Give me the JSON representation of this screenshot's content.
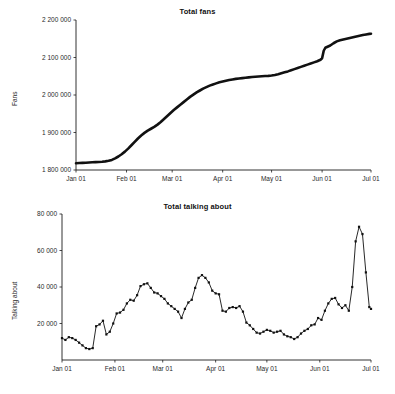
{
  "page": {
    "background": "#ffffff",
    "ink": "#111111",
    "width": 395,
    "height": 394
  },
  "chart_data": [
    {
      "id": "total-fans",
      "type": "line",
      "title": "Total fans",
      "xlabel": "",
      "ylabel": "Fans",
      "ylim": [
        1800000,
        2200000
      ],
      "yticks": [
        1800000,
        1900000,
        2000000,
        2100000,
        2200000
      ],
      "ytick_labels": [
        "1 800 000",
        "1 900 000",
        "2 000 000",
        "2 100 000",
        "2 200 000"
      ],
      "xticks": [
        0,
        31,
        59,
        90,
        120,
        151,
        181
      ],
      "xtick_labels": [
        "Jan 01",
        "Feb 01",
        "Mar 01",
        "Apr 01",
        "May 01",
        "Jun 01",
        "Jul 01"
      ],
      "xlim": [
        0,
        181
      ],
      "grid": false,
      "legend": false,
      "markers": false,
      "line_color": "#111111",
      "series": [
        {
          "name": "Total fans",
          "x": [
            0,
            2,
            4,
            6,
            8,
            10,
            12,
            14,
            16,
            18,
            20,
            22,
            24,
            26,
            28,
            30,
            32,
            34,
            36,
            38,
            40,
            42,
            44,
            46,
            48,
            50,
            52,
            54,
            56,
            58,
            60,
            62,
            64,
            66,
            68,
            70,
            72,
            74,
            76,
            78,
            80,
            82,
            84,
            86,
            88,
            90,
            92,
            94,
            96,
            98,
            100,
            102,
            104,
            106,
            108,
            110,
            112,
            114,
            116,
            118,
            120,
            122,
            124,
            126,
            128,
            130,
            132,
            134,
            136,
            138,
            140,
            142,
            144,
            146,
            148,
            150,
            151,
            152,
            153,
            154,
            156,
            158,
            160,
            162,
            164,
            166,
            168,
            170,
            172,
            174,
            176,
            178,
            180,
            181
          ],
          "values": [
            1818000,
            1818500,
            1819000,
            1819500,
            1820000,
            1820500,
            1821000,
            1821500,
            1822000,
            1823000,
            1824500,
            1827000,
            1831000,
            1836000,
            1842000,
            1849000,
            1857000,
            1866000,
            1875000,
            1884000,
            1892000,
            1899000,
            1905000,
            1910000,
            1915000,
            1921000,
            1928000,
            1936000,
            1944000,
            1952000,
            1960000,
            1967000,
            1974000,
            1981000,
            1988000,
            1995000,
            2001000,
            2007000,
            2012000,
            2017000,
            2021000,
            2025000,
            2028000,
            2031000,
            2034000,
            2036000,
            2038000,
            2040000,
            2041500,
            2043000,
            2044000,
            2045000,
            2046000,
            2047000,
            2048000,
            2048800,
            2049500,
            2050000,
            2050500,
            2051000,
            2052000,
            2053500,
            2055500,
            2058000,
            2060500,
            2063000,
            2066000,
            2069000,
            2072000,
            2075000,
            2078000,
            2081000,
            2084000,
            2087000,
            2090000,
            2094000,
            2098000,
            2118000,
            2126000,
            2128000,
            2132000,
            2138000,
            2143000,
            2146000,
            2148000,
            2150000,
            2152000,
            2154000,
            2156000,
            2158000,
            2160000,
            2161500,
            2163000,
            2163500
          ]
        }
      ]
    },
    {
      "id": "total-talking-about",
      "type": "line",
      "title": "Total talking about",
      "xlabel": "",
      "ylabel": "Talking about",
      "ylim": [
        0,
        80000
      ],
      "yticks": [
        20000,
        40000,
        60000,
        80000
      ],
      "ytick_labels": [
        "20 000",
        "40 000",
        "60 000",
        "80 000"
      ],
      "xticks": [
        0,
        31,
        59,
        90,
        120,
        151,
        181
      ],
      "xtick_labels": [
        "Jan 01",
        "Feb 01",
        "Mar 01",
        "Apr 01",
        "May 01",
        "Jun 01",
        "Jul 01"
      ],
      "xlim": [
        0,
        181
      ],
      "grid": false,
      "legend": false,
      "markers": true,
      "line_color": "#111111",
      "series": [
        {
          "name": "Total talking about",
          "x": [
            0,
            2,
            4,
            6,
            8,
            10,
            12,
            14,
            16,
            18,
            20,
            22,
            24,
            26,
            28,
            30,
            32,
            34,
            36,
            38,
            40,
            42,
            44,
            46,
            48,
            50,
            52,
            54,
            56,
            58,
            60,
            62,
            64,
            66,
            68,
            70,
            72,
            74,
            76,
            78,
            80,
            82,
            84,
            86,
            88,
            90,
            92,
            94,
            96,
            98,
            100,
            102,
            104,
            106,
            108,
            110,
            112,
            114,
            116,
            118,
            120,
            122,
            124,
            126,
            128,
            130,
            132,
            134,
            136,
            138,
            140,
            142,
            144,
            146,
            148,
            150,
            152,
            154,
            156,
            158,
            160,
            162,
            164,
            166,
            168,
            170,
            172,
            174,
            176,
            178,
            180,
            181
          ],
          "values": [
            12000,
            11000,
            12500,
            12000,
            11000,
            9500,
            8000,
            6500,
            6000,
            6500,
            18500,
            19500,
            21500,
            14000,
            15500,
            20000,
            25500,
            26000,
            27500,
            31000,
            33000,
            32500,
            35500,
            40500,
            41500,
            42000,
            39500,
            37000,
            36500,
            35000,
            33500,
            31000,
            29500,
            28000,
            26500,
            23000,
            28000,
            31500,
            33000,
            39500,
            45000,
            46500,
            45000,
            42500,
            38000,
            36500,
            36000,
            27000,
            26500,
            28500,
            29000,
            28500,
            29500,
            26500,
            20500,
            19000,
            17000,
            15000,
            14500,
            15500,
            16500,
            16000,
            15000,
            15500,
            16000,
            14000,
            13000,
            12500,
            11500,
            12500,
            14500,
            16000,
            17000,
            19000,
            19500,
            23000,
            22000,
            27000,
            31000,
            33500,
            34000,
            30500,
            28500,
            30000,
            27000,
            40000,
            65000,
            73000,
            69000,
            48000,
            29000,
            28000
          ]
        }
      ]
    }
  ]
}
